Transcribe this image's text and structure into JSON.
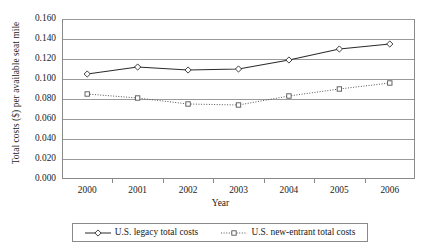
{
  "chart_data": {
    "type": "line",
    "title": "",
    "xlabel": "Year",
    "ylabel": "Total costs ($) per available seat mile",
    "categories": [
      "2000",
      "2001",
      "2002",
      "2003",
      "2004",
      "2005",
      "2006"
    ],
    "ylim": [
      0.0,
      0.16
    ],
    "ytick_labels": [
      "0.000",
      "0.020",
      "0.040",
      "0.060",
      "0.080",
      "0.100",
      "0.120",
      "0.140",
      "0.160"
    ],
    "ytick_values": [
      0.0,
      0.02,
      0.04,
      0.06,
      0.08,
      0.1,
      0.12,
      0.14,
      0.16
    ],
    "grid": true,
    "legend_position": "bottom",
    "series": [
      {
        "name": "U.S. legacy total costs",
        "values": [
          0.105,
          0.112,
          0.109,
          0.11,
          0.119,
          0.13,
          0.135
        ],
        "line_style": "solid",
        "marker": "diamond",
        "color": "#2b2b2b"
      },
      {
        "name": "U.S. new-entrant total costs",
        "values": [
          0.085,
          0.081,
          0.075,
          0.074,
          0.083,
          0.09,
          0.096
        ],
        "line_style": "dotted",
        "marker": "square",
        "color": "#555555"
      }
    ]
  },
  "axes": {
    "y_title": "Total costs ($) per available seat mile",
    "x_title": "Year"
  },
  "legend": {
    "entries": [
      {
        "label": "U.S. legacy total costs"
      },
      {
        "label": "U.S. new-entrant total costs"
      }
    ]
  },
  "colors": {
    "frame": "#8a8a8a",
    "gridline": "#9a9a9a",
    "series_legacy": "#2b2b2b",
    "series_new_entrant": "#555555",
    "background": "#ffffff"
  }
}
